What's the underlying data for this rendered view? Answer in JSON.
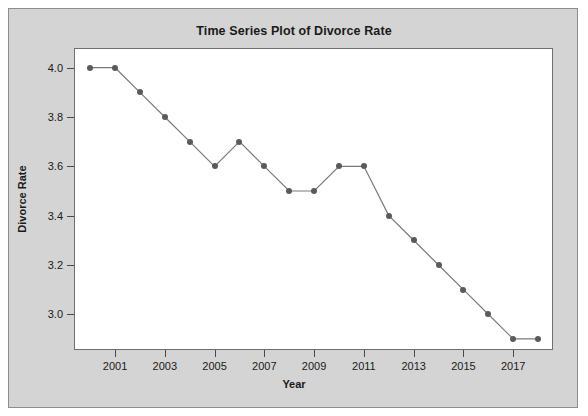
{
  "figure": {
    "background_color": "#ffffff",
    "panel_color": "#d4d4d4",
    "plot_background_color": "#ffffff",
    "frame_color": "#6f6f6f",
    "marker_color": "#5a5a5a",
    "line_color": "#7a7a7a"
  },
  "chart_data": {
    "type": "line",
    "title": "Time Series Plot of Divorce Rate",
    "xlabel": "Year",
    "ylabel": "Divorce Rate",
    "x": [
      2000,
      2001,
      2002,
      2003,
      2004,
      2005,
      2006,
      2007,
      2008,
      2009,
      2010,
      2011,
      2012,
      2013,
      2014,
      2015,
      2016,
      2017,
      2018
    ],
    "values": [
      4.0,
      4.0,
      3.9,
      3.8,
      3.7,
      3.6,
      3.7,
      3.6,
      3.5,
      3.5,
      3.6,
      3.6,
      3.4,
      3.3,
      3.2,
      3.1,
      3.0,
      2.9,
      2.9
    ],
    "series": [
      {
        "name": "Divorce Rate",
        "values": [
          4.0,
          4.0,
          3.9,
          3.8,
          3.7,
          3.6,
          3.7,
          3.6,
          3.5,
          3.5,
          3.6,
          3.6,
          3.4,
          3.3,
          3.2,
          3.1,
          3.0,
          2.9,
          2.9
        ]
      }
    ],
    "xticks": [
      2001,
      2003,
      2005,
      2007,
      2009,
      2011,
      2013,
      2015,
      2017
    ],
    "xtick_labels": [
      "2001",
      "2003",
      "2005",
      "2007",
      "2009",
      "2011",
      "2013",
      "2015",
      "2017"
    ],
    "yticks": [
      3.0,
      3.2,
      3.4,
      3.6,
      3.8,
      4.0
    ],
    "ytick_labels": [
      "3.0",
      "3.2",
      "3.4",
      "3.6",
      "3.8",
      "4.0"
    ],
    "xlim": [
      1999.35,
      2018.6
    ],
    "ylim": [
      2.855,
      4.08
    ],
    "grid": false,
    "legend": false,
    "marker": "filled-circle"
  }
}
